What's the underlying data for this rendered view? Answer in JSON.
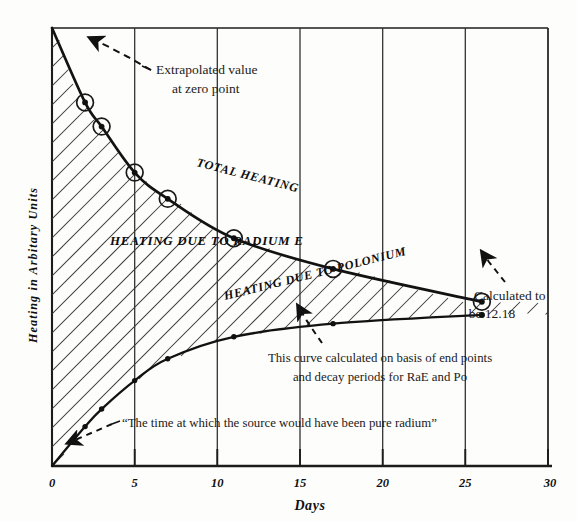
{
  "chart_data": {
    "type": "line",
    "title": "",
    "xlabel": "Days",
    "ylabel": "Heating in Arbitary Units",
    "xlim": [
      0,
      30
    ],
    "ylim": [
      0,
      100
    ],
    "grid": true,
    "grid_orientation": "vertical",
    "legend": "inline-curve-labels",
    "xticks": [
      "0",
      "5",
      "10",
      "15",
      "20",
      "25",
      "30"
    ],
    "xtick_values": [
      0,
      5,
      10,
      15,
      20,
      25,
      30
    ],
    "yticks": [],
    "series": [
      {
        "name": "Total Heating",
        "label": "TOTAL HEATING",
        "marker": "circled-dot",
        "x": [
          0,
          2,
          3,
          5,
          7,
          11,
          17,
          26
        ],
        "y": [
          100,
          83,
          77.5,
          67,
          61,
          52,
          45,
          37.5
        ]
      },
      {
        "name": "Heating due to Polonium",
        "label": "HEATING DUE TO POLONIUM",
        "marker": "small-dot",
        "x": [
          0,
          2,
          3,
          5,
          7,
          11,
          17,
          26
        ],
        "y": [
          0,
          9,
          13,
          19.5,
          24.5,
          29.5,
          32.5,
          34.5
        ]
      }
    ],
    "shaded_region": {
      "label": "HEATING DUE TO RADIUM E",
      "between": [
        "Heating due to Polonium",
        "Total Heating"
      ],
      "fill": "diagonal-hatch"
    },
    "annotations": [
      {
        "name": "extrapolated-value",
        "lines": [
          "Extrapolated value",
          "at zero point"
        ],
        "points_to": "zero-point-of-total-heating-curve"
      },
      {
        "name": "calculated-value",
        "lines": [
          "Calculated to",
          "be 12.18"
        ],
        "value": "12.18",
        "points_to": "right-endpoint-of-curves"
      },
      {
        "name": "curve-basis-note",
        "lines": [
          "This curve calculated on basis of end points",
          "and decay periods for RaE and Po"
        ],
        "points_to": "polonium-curve"
      },
      {
        "name": "pure-radium-note",
        "lines": [
          "“The time at which the source would have been pure radium”"
        ],
        "points_to": "origin-of-polonium-curve"
      }
    ]
  },
  "colors": {
    "ink": "#111111",
    "paper": "#fdfdfb",
    "grid": "#2a2a2a",
    "hatch": "#3a3a3a"
  }
}
